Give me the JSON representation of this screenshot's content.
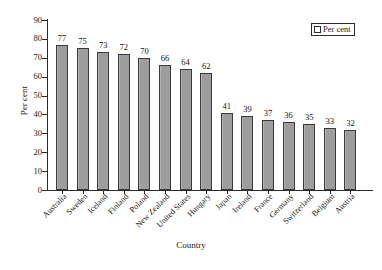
{
  "chart_data": {
    "type": "bar",
    "title": "",
    "xlabel": "Country",
    "ylabel": "Per cent",
    "ylim": [
      0,
      90
    ],
    "ytick_values": [
      0,
      10,
      20,
      30,
      40,
      50,
      60,
      70,
      80,
      90
    ],
    "grid": false,
    "legend_position": "top-right",
    "legend": [
      "Per cent"
    ],
    "categories": [
      "Australia",
      "Sweden",
      "Iceland",
      "Finland",
      "Poland",
      "New Zealand",
      "United States",
      "Hungary",
      "Japan",
      "Ireland",
      "France",
      "Germany",
      "Switzerland",
      "Belgium",
      "Austria"
    ],
    "values": [
      77,
      75,
      73,
      72,
      70,
      66,
      64,
      62,
      41,
      39,
      37,
      36,
      35,
      33,
      32
    ],
    "series": [
      {
        "name": "Per cent",
        "values": [
          77,
          75,
          73,
          72,
          70,
          66,
          64,
          62,
          41,
          39,
          37,
          36,
          35,
          33,
          32
        ]
      }
    ],
    "bar_color": "#9d9d9d",
    "bar_edge_color": "#3a3a3a"
  },
  "axis": {
    "y_title": "Per cent",
    "x_title": "Country",
    "y_ticks": [
      "0",
      "10",
      "20",
      "30",
      "40",
      "50",
      "60",
      "70",
      "80",
      "90"
    ]
  },
  "legend": {
    "label": "Per cent"
  },
  "caption": {
    "text": ""
  }
}
